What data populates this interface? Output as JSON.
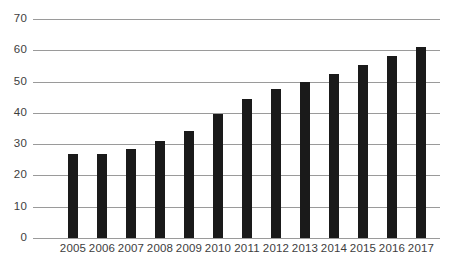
{
  "chart_data": {
    "type": "bar",
    "title": "",
    "subtitle": "",
    "xlabel": "",
    "ylabel": "",
    "categories": [
      "2005",
      "2006",
      "2007",
      "2008",
      "2009",
      "2010",
      "2011",
      "2012",
      "2013",
      "2014",
      "2015",
      "2016",
      "2017"
    ],
    "values": [
      27,
      26.7,
      28.5,
      31,
      34.3,
      39.7,
      44.3,
      47.5,
      50,
      52.5,
      55.2,
      58.3,
      61
    ],
    "ylim": [
      0,
      70
    ],
    "y_ticks": [
      0,
      10,
      20,
      30,
      40,
      50,
      60,
      70
    ],
    "y_tick_labels": [
      "0",
      "10",
      "20",
      "30",
      "40",
      "50",
      "60",
      "70"
    ],
    "grid": "horizontal",
    "legend": "none",
    "series": [
      {
        "name": "",
        "values": [
          27,
          26.7,
          28.5,
          31,
          34.3,
          39.7,
          44.3,
          47.5,
          50,
          52.5,
          55.2,
          58.3,
          61
        ]
      }
    ],
    "annotations": [],
    "colors": {
      "bar": "#1a1a1a",
      "gridline": "#9a9a9a",
      "tick_label": "#3d3d3d",
      "background": "#ffffff"
    }
  }
}
